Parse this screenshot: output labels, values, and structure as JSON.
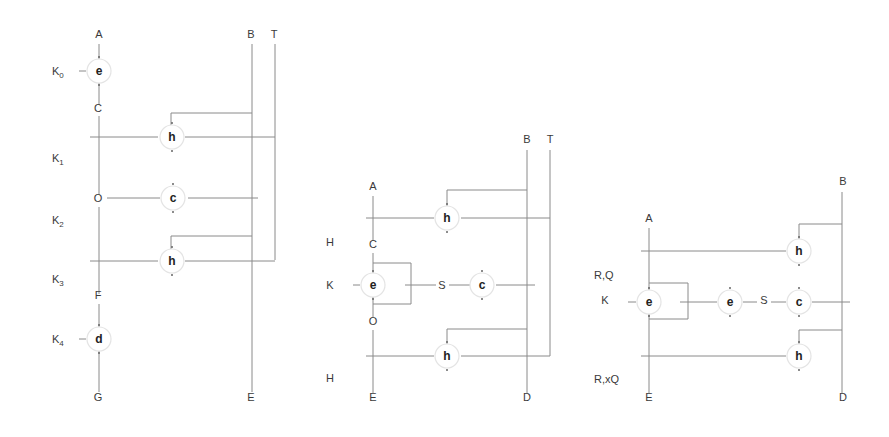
{
  "colors": {
    "wire": "#8a8a8a",
    "text": "#3a3a3a",
    "node_text": "#222222",
    "circle": "#e4e4e4",
    "background": "#ffffff"
  },
  "diagrams": [
    {
      "id": "diagram-1",
      "labels": [
        {
          "text": "A",
          "x": 99,
          "y": 38
        },
        {
          "text": "B",
          "x": 251,
          "y": 38
        },
        {
          "text": "T",
          "x": 274,
          "y": 38
        },
        {
          "text": "K",
          "sub": "0",
          "x": 52,
          "y": 75
        },
        {
          "text": "C",
          "x": 98,
          "y": 112
        },
        {
          "text": "K",
          "sub": "1",
          "x": 52,
          "y": 162
        },
        {
          "text": "O",
          "x": 98,
          "y": 202
        },
        {
          "text": "K",
          "sub": "2",
          "x": 52,
          "y": 224
        },
        {
          "text": "K",
          "sub": "3",
          "x": 52,
          "y": 283
        },
        {
          "text": "F",
          "x": 98,
          "y": 299
        },
        {
          "text": "K",
          "sub": "4",
          "x": 52,
          "y": 343
        },
        {
          "text": "G",
          "x": 98,
          "y": 401
        },
        {
          "text": "E",
          "x": 251,
          "y": 401
        }
      ],
      "nodes": [
        {
          "letter": "e",
          "x": 99,
          "y": 71
        },
        {
          "letter": "h",
          "x": 172,
          "y": 137
        },
        {
          "letter": "c",
          "x": 173,
          "y": 198
        },
        {
          "letter": "h",
          "x": 172,
          "y": 261
        },
        {
          "letter": "d",
          "x": 99,
          "y": 339
        }
      ],
      "wires": [
        "M99,44 L99,61",
        "M99,82 L99,105",
        "M99,116 L99,195",
        "M99,207 L99,294",
        "M99,304 L99,329",
        "M99,350 L99,392",
        "M252,44 L252,392",
        "M275,44 L275,260",
        "M90,137 L158,137",
        "M185,137 L275,137",
        "M252,113 L171,113 L171,125",
        "M107,198 L160,198",
        "M188,198 L258,198",
        "M252,236 L171,236 L171,249",
        "M90,261 L158,261",
        "M185,261 L275,261",
        "M79,71 L86,71",
        "M79,339 L86,339"
      ]
    },
    {
      "id": "diagram-2",
      "labels": [
        {
          "text": "B",
          "x": 527,
          "y": 143
        },
        {
          "text": "T",
          "x": 550,
          "y": 143
        },
        {
          "text": "A",
          "x": 373,
          "y": 190
        },
        {
          "text": "H",
          "x": 330,
          "y": 246
        },
        {
          "text": "C",
          "x": 373,
          "y": 248
        },
        {
          "text": "K",
          "x": 330,
          "y": 289
        },
        {
          "text": "S",
          "x": 442,
          "y": 289
        },
        {
          "text": "O",
          "x": 373,
          "y": 325
        },
        {
          "text": "H",
          "x": 330,
          "y": 382
        },
        {
          "text": "E",
          "x": 373,
          "y": 401
        },
        {
          "text": "D",
          "x": 527,
          "y": 401
        }
      ],
      "nodes": [
        {
          "letter": "h",
          "x": 447,
          "y": 218
        },
        {
          "letter": "e",
          "x": 373,
          "y": 285
        },
        {
          "letter": "c",
          "x": 482,
          "y": 285
        },
        {
          "letter": "h",
          "x": 447,
          "y": 356
        }
      ],
      "wires": [
        "M373,196 L373,241",
        "M373,253 L373,275",
        "M373,296 L373,317",
        "M373,330 L373,393",
        "M527,150 L527,393",
        "M550,150 L550,356",
        "M366,218 L434,218",
        "M461,218 L550,218",
        "M527,190 L447,190 L447,206",
        "M373,263 L411,263 L411,304 L373,304",
        "M405,285 L436,285",
        "M449,285 L470,285",
        "M496,285 L535,285",
        "M527,329 L447,329 L447,344",
        "M366,356 L434,356",
        "M461,356 L550,356",
        "M353,285 L360,285"
      ]
    },
    {
      "id": "diagram-3",
      "labels": [
        {
          "text": "B",
          "x": 843,
          "y": 185
        },
        {
          "text": "A",
          "x": 649,
          "y": 222
        },
        {
          "text": "R,Q",
          "x": 594,
          "y": 279
        },
        {
          "text": "K",
          "x": 605,
          "y": 304
        },
        {
          "text": "S",
          "x": 764,
          "y": 304
        },
        {
          "text": "R,xQ",
          "x": 594,
          "y": 383
        },
        {
          "text": "E",
          "x": 649,
          "y": 401
        },
        {
          "text": "D",
          "x": 843,
          "y": 401
        }
      ],
      "nodes": [
        {
          "letter": "h",
          "x": 799,
          "y": 251
        },
        {
          "letter": "e",
          "x": 649,
          "y": 302
        },
        {
          "letter": "e",
          "x": 730,
          "y": 302
        },
        {
          "letter": "c",
          "x": 799,
          "y": 302
        },
        {
          "letter": "h",
          "x": 799,
          "y": 356
        }
      ],
      "wires": [
        "M649,228 L649,291",
        "M649,313 L649,393",
        "M842,192 L842,393",
        "M641,251 L786,251",
        "M842,224 L799,224 L799,239",
        "M649,283 L688,283 L688,319 L649,319",
        "M680,302 L717,302",
        "M743,302 L757,302",
        "M771,302 L786,302",
        "M812,302 L850,302",
        "M842,330 L799,330 L799,344",
        "M641,356 L786,356",
        "M628,302 L636,302"
      ]
    }
  ]
}
